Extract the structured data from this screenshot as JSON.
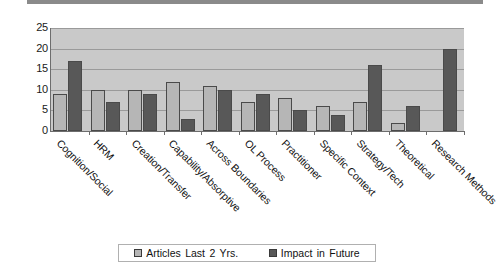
{
  "chart_data": {
    "type": "bar",
    "title": "",
    "xlabel": "",
    "ylabel": "",
    "ylim": [
      0,
      25
    ],
    "yticks": [
      0,
      5,
      10,
      15,
      20,
      25
    ],
    "grid": true,
    "legend_position": "bottom",
    "categories": [
      "Cognition/Social",
      "HRM",
      "Creation/Transfer",
      "Capability/Absorptive",
      "Across Boundaries",
      "OL Process",
      "Practitioner",
      "Specific Context",
      "Strategy/Tech",
      "Theoretical",
      "Research Methods"
    ],
    "series": [
      {
        "name": "Articles Last 2 Yrs.",
        "color": "#b6b6b6",
        "values": [
          9,
          10,
          10,
          12,
          11,
          7,
          8,
          6,
          7,
          2,
          0
        ]
      },
      {
        "name": "Impact in Future",
        "color": "#585858",
        "values": [
          17,
          7,
          9,
          3,
          10,
          9,
          5,
          4,
          16,
          6,
          20
        ]
      }
    ]
  },
  "legend": {
    "items": [
      {
        "label": "Articles Last 2 Yrs.",
        "swatch": "light"
      },
      {
        "label": "Impact in Future",
        "swatch": "dark"
      }
    ]
  },
  "colors": {
    "plot_background": "#c9c9c9",
    "gridline": "#9a9a9a",
    "axis": "#6d6d6d",
    "series_light": "#b6b6b6",
    "series_dark": "#585858",
    "page_background": "#ffffff"
  }
}
